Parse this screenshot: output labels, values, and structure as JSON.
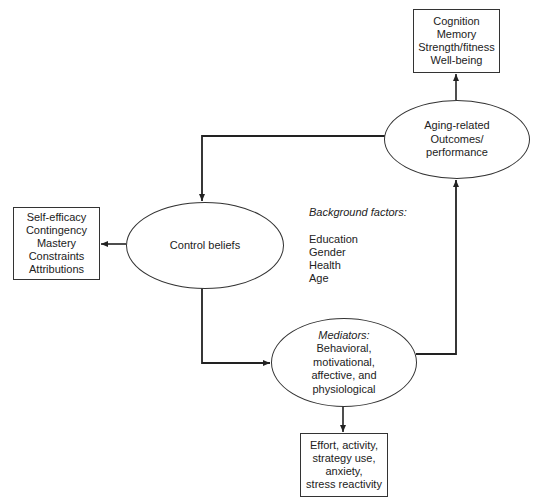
{
  "diagram": {
    "outcomes_box": {
      "lines": [
        "Cognition",
        "Memory",
        "Strength/fitness",
        "Well-being"
      ]
    },
    "aging_ellipse": {
      "lines": [
        "Aging-related",
        "Outcomes/",
        "performance"
      ]
    },
    "control_ellipse": {
      "label": "Control beliefs"
    },
    "control_box": {
      "lines": [
        "Self-efficacy",
        "Contingency",
        "Mastery",
        "Constraints",
        "Attributions"
      ]
    },
    "background_factors": {
      "title": "Background factors:",
      "items": [
        "Education",
        "Gender",
        "Health",
        "Age"
      ]
    },
    "mediators_ellipse": {
      "title": "Mediators:",
      "lines": [
        "Behavioral,",
        "motivational,",
        "affective, and",
        "physiological"
      ]
    },
    "mediators_box": {
      "lines": [
        "Effort, activity,",
        "strategy use,",
        "anxiety,",
        "stress reactivity"
      ]
    },
    "colors": {
      "stroke": "#333333",
      "text": "#222222",
      "background": "#ffffff"
    }
  }
}
